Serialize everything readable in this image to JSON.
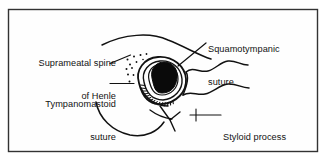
{
  "figure": {
    "background_color": "#ffffff",
    "border_color": "#2b2b2b",
    "ink_color": "#111111",
    "frame": {
      "x": 8,
      "y": 9,
      "width": 310,
      "height": 143
    },
    "labels": [
      {
        "id": "suprameatal-spine-of-henle",
        "line1": "Suprameatal spine",
        "line2": "of Henle",
        "align": "right",
        "x": 28,
        "y": 36
      },
      {
        "id": "tympanomastoid-suture",
        "line1": "Tympanomastoid",
        "line2": "suture",
        "align": "right",
        "x": 28,
        "y": 77
      },
      {
        "id": "squamotympanic-suture",
        "line1": "Squamotympanic",
        "line2": "suture",
        "align": "left",
        "x": 208,
        "y": 22
      },
      {
        "id": "styloid-process",
        "line1": "Styloid process",
        "line2": "",
        "align": "left",
        "x": 223,
        "y": 111
      }
    ],
    "structures": [
      {
        "id": "external-acoustic-meatus",
        "description": "black filled oval opening of ear canal"
      },
      {
        "id": "meatal-rim",
        "description": "concentric oval rim around ear canal"
      },
      {
        "id": "tympanomastoid-hatching",
        "description": "dense hatch marks along inferior meatal rim"
      },
      {
        "id": "suprameatal-stipple",
        "description": "stippled dots marking suprameatal spine of Henle"
      },
      {
        "id": "temporal-line",
        "description": "sweeping curve above meatus"
      },
      {
        "id": "mastoid-outline",
        "description": "curve sweeping to lower left"
      },
      {
        "id": "zygomatic-contours",
        "description": "two wavy lines extending to the right"
      },
      {
        "id": "styloid-spur",
        "description": "short pointed process below meatus"
      }
    ]
  }
}
